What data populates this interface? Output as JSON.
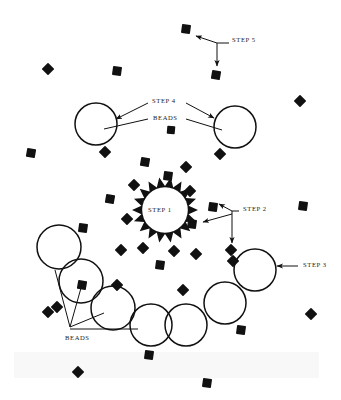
{
  "figure": {
    "background_color": "#ffffff",
    "ink_color": "#111111",
    "width": 341,
    "height": 400,
    "labels": [
      {
        "id": "step5",
        "text": "STEP 5",
        "x": 232,
        "y": 40
      },
      {
        "id": "step4",
        "text": "STEP 4",
        "x": 152,
        "y": 101
      },
      {
        "id": "beads_top",
        "text": "BEADS",
        "x": 153,
        "y": 118
      },
      {
        "id": "step1",
        "text": "STEP 1",
        "x": 148,
        "y": 210
      },
      {
        "id": "step2",
        "text": "STEP 2",
        "x": 243,
        "y": 209
      },
      {
        "id": "step3",
        "text": "STEP 3",
        "x": 303,
        "y": 265
      },
      {
        "id": "beads_bottom",
        "text": "BEADS",
        "x": 65,
        "y": 338
      }
    ],
    "beads": [
      {
        "cx": 186,
        "cy": 29,
        "size": 9,
        "rot": 8
      },
      {
        "cx": 216,
        "cy": 75,
        "size": 9,
        "rot": 10
      },
      {
        "cx": 48,
        "cy": 69,
        "size": 9,
        "rot": 45
      },
      {
        "cx": 117,
        "cy": 71,
        "size": 9,
        "rot": 8
      },
      {
        "cx": 300,
        "cy": 101,
        "size": 9,
        "rot": 45
      },
      {
        "cx": 31,
        "cy": 153,
        "size": 9,
        "rot": 10
      },
      {
        "cx": 105,
        "cy": 152,
        "size": 9,
        "rot": 45
      },
      {
        "cx": 171,
        "cy": 130,
        "size": 8,
        "rot": 5
      },
      {
        "cx": 220,
        "cy": 154,
        "size": 9,
        "rot": 45
      },
      {
        "cx": 145,
        "cy": 162,
        "size": 9,
        "rot": 10
      },
      {
        "cx": 186,
        "cy": 167,
        "size": 9,
        "rot": 45
      },
      {
        "cx": 168,
        "cy": 176,
        "size": 9,
        "rot": 8
      },
      {
        "cx": 134,
        "cy": 185,
        "size": 9,
        "rot": 45
      },
      {
        "cx": 190,
        "cy": 191,
        "size": 9,
        "rot": 45
      },
      {
        "cx": 110,
        "cy": 199,
        "size": 9,
        "rot": 10
      },
      {
        "cx": 213,
        "cy": 207,
        "size": 9,
        "rot": 8
      },
      {
        "cx": 303,
        "cy": 206,
        "size": 9,
        "rot": 8
      },
      {
        "cx": 127,
        "cy": 219,
        "size": 9,
        "rot": 45
      },
      {
        "cx": 192,
        "cy": 224,
        "size": 9,
        "rot": 8
      },
      {
        "cx": 83,
        "cy": 228,
        "size": 9,
        "rot": 8
      },
      {
        "cx": 121,
        "cy": 250,
        "size": 9,
        "rot": 45
      },
      {
        "cx": 143,
        "cy": 248,
        "size": 9,
        "rot": 45
      },
      {
        "cx": 174,
        "cy": 251,
        "size": 9,
        "rot": 45
      },
      {
        "cx": 196,
        "cy": 254,
        "size": 9,
        "rot": 45
      },
      {
        "cx": 231,
        "cy": 250,
        "size": 9,
        "rot": 45
      },
      {
        "cx": 160,
        "cy": 265,
        "size": 9,
        "rot": 8
      },
      {
        "cx": 233,
        "cy": 261,
        "size": 9,
        "rot": 45
      },
      {
        "cx": 57,
        "cy": 307,
        "size": 9,
        "rot": 45
      },
      {
        "cx": 117,
        "cy": 285,
        "size": 9,
        "rot": 45
      },
      {
        "cx": 183,
        "cy": 290,
        "size": 9,
        "rot": 45
      },
      {
        "cx": 82,
        "cy": 285,
        "size": 9,
        "rot": 10
      },
      {
        "cx": 241,
        "cy": 330,
        "size": 9,
        "rot": 8
      },
      {
        "cx": 311,
        "cy": 314,
        "size": 9,
        "rot": 45
      },
      {
        "cx": 149,
        "cy": 355,
        "size": 9,
        "rot": 8
      },
      {
        "cx": 78,
        "cy": 372,
        "size": 9,
        "rot": 45
      },
      {
        "cx": 207,
        "cy": 383,
        "size": 9,
        "rot": 8
      },
      {
        "cx": 48,
        "cy": 312,
        "size": 9,
        "rot": 45
      }
    ],
    "circles": [
      {
        "id": "circle-step4-left",
        "cx": 96,
        "cy": 124,
        "r": 21
      },
      {
        "id": "circle-step4-right",
        "cx": 235,
        "cy": 127,
        "r": 21
      },
      {
        "id": "circle-chain-1",
        "cx": 59,
        "cy": 247,
        "r": 22
      },
      {
        "id": "circle-chain-2",
        "cx": 81,
        "cy": 281,
        "r": 22
      },
      {
        "id": "circle-chain-3",
        "cx": 113,
        "cy": 308,
        "r": 22
      },
      {
        "id": "circle-chain-4",
        "cx": 151,
        "cy": 325,
        "r": 21
      },
      {
        "id": "circle-chain-5",
        "cx": 186,
        "cy": 325,
        "r": 21
      },
      {
        "id": "circle-chain-6",
        "cx": 225,
        "cy": 303,
        "r": 21
      },
      {
        "id": "circle-step3",
        "cx": 255,
        "cy": 270,
        "r": 21
      }
    ],
    "gear": {
      "id": "gear-step1",
      "cx": 165,
      "cy": 210,
      "outer_r": 33,
      "inner_r": 24,
      "teeth": 18
    }
  }
}
